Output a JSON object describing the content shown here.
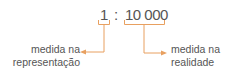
{
  "scale": {
    "left_value": "1",
    "separator": ":",
    "right_value": "10 000"
  },
  "labels": {
    "left_line1": "medida na",
    "left_line2": "representação",
    "right_line1": "medida na",
    "right_line2": "realidade"
  },
  "colors": {
    "accent": "#e8a060",
    "text": "#555555"
  }
}
